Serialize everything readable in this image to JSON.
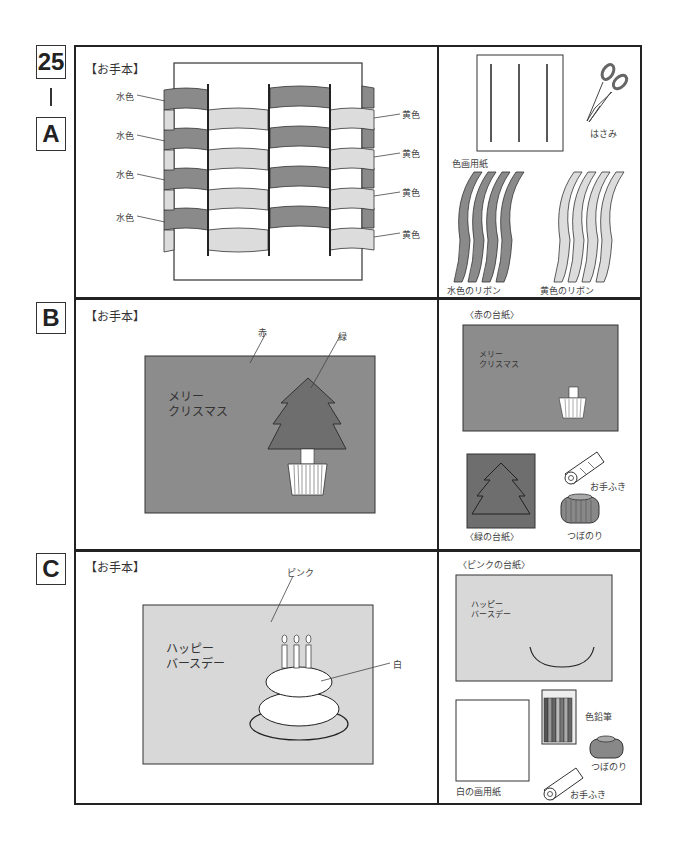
{
  "problem": {
    "number": "25",
    "dash": "|",
    "sections": [
      "A",
      "B",
      "C"
    ]
  },
  "sectionA": {
    "model_label": "【お手本】",
    "left_labels": [
      "水色",
      "水色",
      "水色",
      "水色"
    ],
    "right_labels": [
      "黄色",
      "黄色",
      "黄色",
      "黄色"
    ],
    "materials": {
      "paper": "色画用紙",
      "scissors": "はさみ",
      "blue_ribbon": "水色のリボン",
      "yellow_ribbon": "黄色のリボン"
    },
    "colors": {
      "blue": "#8a8a8a",
      "yellow": "#dcdcdc"
    }
  },
  "sectionB": {
    "model_label": "【お手本】",
    "annotation_red": "赤",
    "annotation_green": "緑",
    "card_text": "メリー\nクリスマス",
    "materials": {
      "red_base": "〈赤の台紙〉",
      "red_base_text": "メリー\nクリスマス",
      "green_base": "〈緑の台紙〉",
      "towel": "お手ふき",
      "glue": "つぼのり"
    },
    "colors": {
      "red": "#8c8c8c",
      "green": "#6e6e6e"
    }
  },
  "sectionC": {
    "model_label": "【お手本】",
    "annotation_pink": "ピンク",
    "annotation_white": "白",
    "card_text": "ハッピー\nバースデー",
    "materials": {
      "pink_base": "〈ピンクの台紙〉",
      "pink_base_text": "ハッピー\nバースデー",
      "white_paper": "白の画用紙",
      "pencils": "色鉛筆",
      "glue": "つぼのり",
      "towel": "お手ふき"
    },
    "colors": {
      "pink": "#d8d8d8"
    }
  }
}
